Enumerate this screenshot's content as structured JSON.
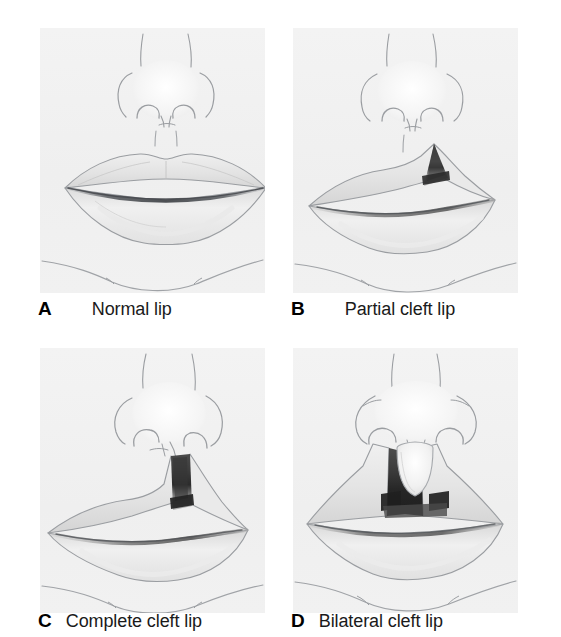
{
  "figure": {
    "background_color": "#ffffff",
    "panel_background_color": "#f3f3f3",
    "panel_count": 4,
    "layout": "2x2 grid"
  },
  "panels": [
    {
      "letter": "A",
      "label": "Normal lip",
      "illustration": "normal-lip",
      "description": "Frontal view of nose and mouth with intact upper lip",
      "cleft_count": 0
    },
    {
      "letter": "B",
      "label": "Partial cleft lip",
      "illustration": "partial-cleft-lip",
      "description": "Unilateral notch in the upper lip not reaching the nostril",
      "cleft_count": 1
    },
    {
      "letter": "C",
      "label": "Complete cleft lip",
      "illustration": "complete-cleft-lip",
      "description": "Unilateral cleft extending from lip margin into the nostril floor",
      "cleft_count": 1
    },
    {
      "letter": "D",
      "label": "Bilateral cleft lip",
      "illustration": "bilateral-cleft-lip",
      "description": "Two clefts flanking a central prolabium segment",
      "cleft_count": 2
    }
  ],
  "colors": {
    "line": "#8c8f93",
    "line_dark": "#6e7276",
    "skin_shade": "#e6e6e6",
    "lip_fill": "#ededed",
    "lip_shade": "#d8d8d8",
    "cleft_dark": "#3a3a3a",
    "cleft_mid": "#7d7d7d",
    "cleft_light": "#b4b4b4",
    "mouth_line": "#5a5d61",
    "caption_text": "#1a1a1a"
  }
}
